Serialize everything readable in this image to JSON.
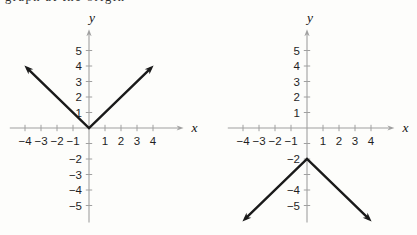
{
  "page": {
    "background_color": "#fdfdfb",
    "top_clipped_text": "graph at the origin"
  },
  "figure": {
    "axis_color": "#a0a0a0",
    "curve_color": "#1a1a1a",
    "label_color": "#1f1f1f"
  },
  "chart_data": [
    {
      "type": "line",
      "description": "V-shaped absolute-value graph opening upward, vertex at the origin (y = |x|)",
      "xlabel": "x",
      "ylabel": "y",
      "xlim": [
        -4.95,
        5.6
      ],
      "ylim": [
        -6.1,
        6.05
      ],
      "grid": false,
      "x_ticks": [
        {
          "value": -4,
          "label": "−4"
        },
        {
          "value": -3,
          "label": "−3"
        },
        {
          "value": -2,
          "label": "−2"
        },
        {
          "value": -1,
          "label": "−1"
        },
        {
          "value": 1,
          "label": "1"
        },
        {
          "value": 2,
          "label": "2"
        },
        {
          "value": 3,
          "label": "3"
        },
        {
          "value": 4,
          "label": "4"
        }
      ],
      "y_ticks": [
        {
          "value": 5,
          "label": "5"
        },
        {
          "value": 4,
          "label": "4"
        },
        {
          "value": 3,
          "label": "3"
        },
        {
          "value": 2,
          "label": "2"
        },
        {
          "value": 1,
          "label": "1"
        },
        {
          "value": -1,
          "label": ""
        },
        {
          "value": -2,
          "label": "−2"
        },
        {
          "value": -3,
          "label": "−3"
        },
        {
          "value": -4,
          "label": "−4"
        },
        {
          "value": -5,
          "label": "−5"
        }
      ],
      "series": [
        {
          "name": "absolute-value-curve",
          "vertex": [
            0,
            0
          ],
          "points": [
            [
              -3.9,
              3.9
            ],
            [
              0,
              0
            ],
            [
              3.9,
              3.9
            ]
          ],
          "arrowheads": "both-ends"
        }
      ]
    },
    {
      "type": "line",
      "description": "Inverted V-shaped graph opening downward, vertex at (0, −2) (y = −|x| − 2)",
      "xlabel": "x",
      "ylabel": "y",
      "xlim": [
        -4.95,
        5.15
      ],
      "ylim": [
        -6.1,
        6.05
      ],
      "grid": false,
      "x_ticks": [
        {
          "value": -4,
          "label": "−4"
        },
        {
          "value": -3,
          "label": "−3"
        },
        {
          "value": -2,
          "label": "−2"
        },
        {
          "value": -1,
          "label": "−1"
        },
        {
          "value": 1,
          "label": "1"
        },
        {
          "value": 2,
          "label": "2"
        },
        {
          "value": 3,
          "label": "3"
        },
        {
          "value": 4,
          "label": "4"
        }
      ],
      "y_ticks": [
        {
          "value": 5,
          "label": "5"
        },
        {
          "value": 4,
          "label": "4"
        },
        {
          "value": 3,
          "label": "3"
        },
        {
          "value": 2,
          "label": "2"
        },
        {
          "value": 1,
          "label": "1"
        },
        {
          "value": -1,
          "label": ""
        },
        {
          "value": -2,
          "label": "−2"
        },
        {
          "value": -3,
          "label": ""
        },
        {
          "value": -4,
          "label": "−4"
        },
        {
          "value": -5,
          "label": "−5"
        }
      ],
      "series": [
        {
          "name": "negative-absolute-value-curve",
          "vertex": [
            0,
            -2
          ],
          "points": [
            [
              -3.9,
              -5.9
            ],
            [
              0,
              -2
            ],
            [
              3.9,
              -5.9
            ]
          ],
          "arrowheads": "both-ends"
        }
      ]
    }
  ]
}
